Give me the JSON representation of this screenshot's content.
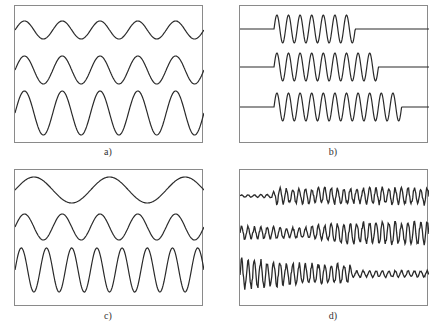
{
  "figure": {
    "panels": [
      {
        "id": "a",
        "label": "a)",
        "box": {
          "x": 14,
          "y": 5,
          "w": 189,
          "h": 138
        },
        "label_pos": {
          "x": 93,
          "y": 146
        },
        "description": "Three sine waves of equal frequency, increasing amplitude",
        "traces": [
          {
            "type": "sine",
            "center": 24,
            "amp": 9,
            "cycles": 5,
            "phase": 0
          },
          {
            "type": "sine",
            "center": 64,
            "amp": 14,
            "cycles": 5,
            "phase": 0
          },
          {
            "type": "sine",
            "center": 107,
            "amp": 22,
            "cycles": 5,
            "phase": 0
          }
        ]
      },
      {
        "id": "b",
        "label": "b)",
        "box": {
          "x": 239,
          "y": 5,
          "w": 189,
          "h": 138
        },
        "label_pos": {
          "x": 318,
          "y": 146
        },
        "description": "Three sine bursts of equal frequency and amplitude, increasing duration",
        "traces": [
          {
            "type": "burst",
            "center": 23,
            "amp": 14,
            "start": 34,
            "cycles": 7,
            "period": 11.6
          },
          {
            "type": "burst",
            "center": 61,
            "amp": 14,
            "start": 34,
            "cycles": 9,
            "period": 11.6
          },
          {
            "type": "burst",
            "center": 101,
            "amp": 14,
            "start": 34,
            "cycles": 11,
            "period": 11.6
          }
        ]
      },
      {
        "id": "c",
        "label": "c)",
        "box": {
          "x": 14,
          "y": 169,
          "w": 189,
          "h": 137
        },
        "label_pos": {
          "x": 93,
          "y": 310
        },
        "description": "Three sine waves with increasing frequency and amplitude",
        "traces": [
          {
            "type": "sine",
            "center": 20,
            "amp": 13,
            "cycles": 2.5,
            "phase": 0
          },
          {
            "type": "sine",
            "center": 57,
            "amp": 13,
            "cycles": 5,
            "phase": 0
          },
          {
            "type": "sine",
            "center": 100,
            "amp": 22,
            "cycles": 7.5,
            "phase": 0
          }
        ]
      },
      {
        "id": "d",
        "label": "d)",
        "box": {
          "x": 239,
          "y": 169,
          "w": 189,
          "h": 137
        },
        "label_pos": {
          "x": 318,
          "y": 310
        },
        "description": "Three noisy recorded oscillation traces with varying amplitude envelopes",
        "traces": [
          {
            "type": "noisy",
            "center": 26,
            "period": 6.4,
            "env": [
              [
                0,
                1
              ],
              [
                30,
                1.5
              ],
              [
                36,
                7
              ],
              [
                189,
                8
              ]
            ],
            "seed": 3
          },
          {
            "type": "noisy",
            "center": 63,
            "period": 6.4,
            "env": [
              [
                0,
                6
              ],
              [
                60,
                5
              ],
              [
                110,
                10
              ],
              [
                189,
                10
              ]
            ],
            "seed": 7
          },
          {
            "type": "noisy",
            "center": 104,
            "period": 6.4,
            "env": [
              [
                0,
                14
              ],
              [
                70,
                9
              ],
              [
                110,
                9
              ],
              [
                112,
                3
              ],
              [
                189,
                3
              ]
            ],
            "seed": 11
          }
        ]
      }
    ],
    "stroke_color": "#2a2a2a",
    "border_color": "#8a8a8a"
  }
}
